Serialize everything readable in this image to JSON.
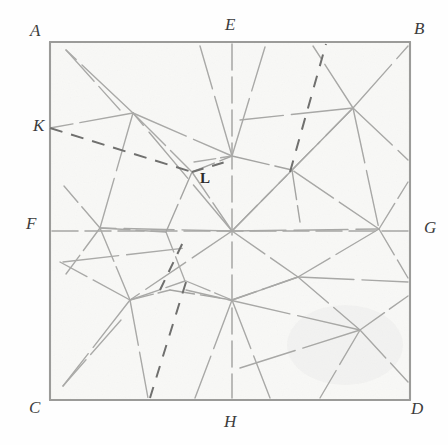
{
  "figure": {
    "medium": "pencil sketch on paper",
    "background_color": "#fdfdfc",
    "paper_tint": "#f7f7f5",
    "ink_color": "#8a8a8a",
    "border_color": "#9a9a99",
    "label_color": "#3c3c3c",
    "square": {
      "left": 50,
      "top": 42,
      "right": 410,
      "bottom": 400
    },
    "labels": [
      {
        "id": "A",
        "text": "A",
        "x": 30,
        "y": 22,
        "style": "italic",
        "corner": "top-left"
      },
      {
        "id": "B",
        "text": "B",
        "x": 414,
        "y": 20,
        "style": "italic",
        "corner": "top-right"
      },
      {
        "id": "C",
        "text": "C",
        "x": 29,
        "y": 399,
        "style": "italic",
        "corner": "bottom-left"
      },
      {
        "id": "D",
        "text": "D",
        "x": 411,
        "y": 400,
        "style": "italic",
        "corner": "bottom-right"
      },
      {
        "id": "E",
        "text": "E",
        "x": 225,
        "y": 16,
        "style": "italic",
        "corner": "top-mid"
      },
      {
        "id": "F",
        "text": "F",
        "x": 26,
        "y": 215,
        "style": "italic",
        "corner": "left-mid"
      },
      {
        "id": "G",
        "text": "G",
        "x": 424,
        "y": 219,
        "style": "italic",
        "corner": "right-mid"
      },
      {
        "id": "H",
        "text": "H",
        "x": 224,
        "y": 413,
        "style": "italic",
        "corner": "bottom-mid"
      },
      {
        "id": "K",
        "text": "K",
        "x": 33,
        "y": 117,
        "style": "italic",
        "corner": "left-upper"
      },
      {
        "id": "L",
        "text": "L",
        "x": 200,
        "y": 171,
        "style": "upright",
        "corner": "interior"
      }
    ],
    "nodes": {
      "A": [
        50,
        42
      ],
      "B": [
        410,
        42
      ],
      "C": [
        50,
        400
      ],
      "D": [
        410,
        400
      ],
      "E": [
        232,
        42
      ],
      "F": [
        50,
        231
      ],
      "G": [
        410,
        231
      ],
      "H": [
        232,
        400
      ],
      "K": [
        50,
        128
      ],
      "L": [
        192,
        172
      ],
      "center": [
        232,
        231
      ],
      "n_upper_left": [
        133,
        113
      ],
      "n_upper_right": [
        353,
        108
      ],
      "n_right_upper": [
        292,
        170
      ],
      "n_left_mid": [
        100,
        228
      ],
      "n_right_mid": [
        379,
        229
      ],
      "n_lower_left": [
        130,
        300
      ],
      "n_lower_right": [
        298,
        277
      ],
      "n_low_left2": [
        185,
        281
      ],
      "n_low_right2": [
        360,
        330
      ]
    },
    "line_styles": {
      "solid": "solid pencil stroke",
      "dashed": "dashed pencil stroke"
    },
    "dashed_segments": [
      "K to L",
      "L to upper area near E-B top edge",
      "interior lower-left diagonal"
    ]
  }
}
